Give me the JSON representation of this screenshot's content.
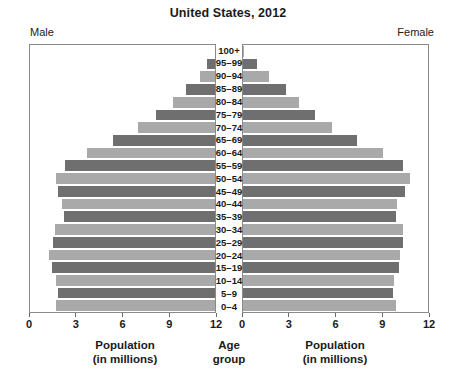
{
  "chart_data": {
    "type": "bar",
    "subtype": "population-pyramid",
    "title": "United States, 2012",
    "xlabel": "Population (in millions)",
    "ylabel": "Age group",
    "grid": false,
    "legend": "none",
    "xlim_left": [
      12,
      0
    ],
    "xlim_right": [
      0,
      12
    ],
    "xticks_left": [
      "12",
      "9",
      "6",
      "3",
      "0"
    ],
    "xticks_right": [
      "0",
      "3",
      "6",
      "9",
      "12"
    ],
    "xtick_values": [
      0,
      3,
      6,
      9,
      12
    ],
    "side_labels": {
      "left": "Male",
      "right": "Female"
    },
    "categories": [
      "100+",
      "95–99",
      "90–94",
      "85–89",
      "80–84",
      "75–79",
      "70–74",
      "65–69",
      "60–64",
      "55–59",
      "50–54",
      "45–49",
      "40–44",
      "35–39",
      "30–34",
      "25–29",
      "20–24",
      "15–19",
      "10–14",
      "5–9",
      "0–4"
    ],
    "series": [
      {
        "name": "Male",
        "side": "left",
        "values": [
          0.02,
          0.5,
          1.0,
          1.9,
          2.7,
          3.8,
          5.0,
          6.6,
          8.3,
          9.7,
          10.3,
          10.2,
          9.9,
          9.8,
          10.4,
          10.5,
          10.8,
          10.6,
          10.3,
          10.2,
          10.3
        ]
      },
      {
        "name": "Female",
        "side": "right",
        "values": [
          0.05,
          0.9,
          1.7,
          2.8,
          3.6,
          4.7,
          5.8,
          7.4,
          9.1,
          10.4,
          10.8,
          10.5,
          10.0,
          9.9,
          10.4,
          10.4,
          10.2,
          10.1,
          9.8,
          9.7,
          9.9
        ]
      }
    ],
    "bar_colors": {
      "dark": "#6f6f6f",
      "light": "#a9a9a9"
    }
  },
  "axis_captions": {
    "left_line1": "Population",
    "left_line2": "(in millions)",
    "center_line1": "Age",
    "center_line2": "group",
    "right_line1": "Population",
    "right_line2": "(in millions)"
  }
}
